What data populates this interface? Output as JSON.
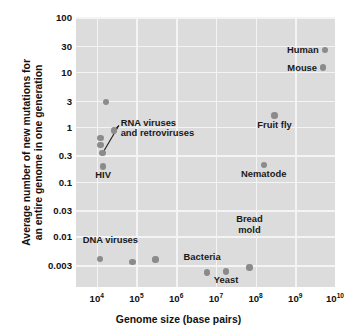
{
  "chart_data": {
    "type": "scatter",
    "title": "",
    "xlabel": "Genome size (base pairs)",
    "ylabel_line1": "Average number of new mutations for",
    "ylabel_line2": "an entire genome in one generation",
    "xscale": "log",
    "yscale": "log",
    "xlim": [
      3000,
      10000000000
    ],
    "ylim": [
      0.0012,
      100
    ],
    "grid": true,
    "legend": "none",
    "xticks": [
      {
        "value": 10000,
        "mantissa": "10",
        "exponent": "4"
      },
      {
        "value": 100000,
        "mantissa": "10",
        "exponent": "5"
      },
      {
        "value": 1000000,
        "mantissa": "10",
        "exponent": "6"
      },
      {
        "value": 10000000,
        "mantissa": "10",
        "exponent": "7"
      },
      {
        "value": 100000000,
        "mantissa": "10",
        "exponent": "8"
      },
      {
        "value": 1000000000,
        "mantissa": "10",
        "exponent": "9"
      },
      {
        "value": 10000000000,
        "mantissa": "10",
        "exponent": "10"
      }
    ],
    "yticks": [
      {
        "value": 100,
        "label": "100"
      },
      {
        "value": 30,
        "label": "30"
      },
      {
        "value": 10,
        "label": "10"
      },
      {
        "value": 3,
        "label": "3"
      },
      {
        "value": 1,
        "label": "1"
      },
      {
        "value": 0.3,
        "label": "0.3"
      },
      {
        "value": 0.1,
        "label": "0.1"
      },
      {
        "value": 0.03,
        "label": "0.03"
      },
      {
        "value": 0.01,
        "label": "0.01"
      },
      {
        "value": 0.003,
        "label": "0.003"
      }
    ],
    "point_color": "#8b8b8b",
    "plot_background": "#dcdcdc",
    "gridline_color": "#f4f4f4",
    "points": [
      {
        "name": "human",
        "x": 5500000000,
        "y": 25,
        "label": "Human",
        "label_pos": "right"
      },
      {
        "name": "mouse",
        "x": 5000000000,
        "y": 12,
        "label": "Mouse",
        "label_pos": "right"
      },
      {
        "name": "fruit-fly",
        "x": 300000000,
        "y": 1.6,
        "label": "Fruit fly",
        "label_pos": "below"
      },
      {
        "name": "nematode",
        "x": 160000000,
        "y": 0.2,
        "label": "Nematode",
        "label_pos": "below"
      },
      {
        "name": "rna-virus-1",
        "x": 17000,
        "y": 2.8,
        "label": "",
        "label_pos": "none"
      },
      {
        "name": "rna-virus-2",
        "x": 27000,
        "y": 0.85,
        "label": "",
        "label_pos": "none"
      },
      {
        "name": "rna-virus-3",
        "x": 12500,
        "y": 0.62,
        "label": "",
        "label_pos": "none"
      },
      {
        "name": "rna-virus-4",
        "x": 12500,
        "y": 0.47,
        "label": "",
        "label_pos": "none"
      },
      {
        "name": "rna-virus-5",
        "x": 14000,
        "y": 0.33,
        "label": "",
        "label_pos": "none"
      },
      {
        "name": "hiv",
        "x": 14500,
        "y": 0.19,
        "label": "HIV",
        "label_pos": "below"
      },
      {
        "name": "dna-virus-1",
        "x": 12000,
        "y": 0.0039,
        "label": "",
        "label_pos": "none"
      },
      {
        "name": "dna-virus-2",
        "x": 80000,
        "y": 0.0034,
        "label": "",
        "label_pos": "none"
      },
      {
        "name": "dna-virus-3",
        "x": 300000,
        "y": 0.0038,
        "label": "",
        "label_pos": "none"
      },
      {
        "name": "bacteria",
        "x": 6000000,
        "y": 0.0022,
        "label": "Bacteria",
        "label_pos": "none"
      },
      {
        "name": "yeast",
        "x": 18000000,
        "y": 0.0023,
        "label": "Yeast",
        "label_pos": "below"
      },
      {
        "name": "bread-mold",
        "x": 70000000,
        "y": 0.0027,
        "label": "",
        "label_pos": "none"
      }
    ],
    "annotations": [
      {
        "name": "rna-viruses",
        "line1": "RNA viruses",
        "line2": "and retroviruses",
        "x": 40000,
        "y": 0.95
      },
      {
        "name": "dna-viruses",
        "line1": "DNA viruses",
        "line2": "",
        "x": 22000,
        "y": 0.0085
      },
      {
        "name": "bacteria",
        "line1": "Bacteria",
        "line2": "",
        "x": 4500000,
        "y": 0.0042
      },
      {
        "name": "bread-mold",
        "line1": "Bread",
        "line2": "mold",
        "x": 70000000,
        "y": 0.0105
      }
    ],
    "leader_lines": [
      {
        "name": "rna-leader-upper",
        "from_x": 36000,
        "from_y": 1.05,
        "to_x": 27000,
        "to_y": 0.85
      },
      {
        "name": "rna-leader-lower",
        "from_x": 36000,
        "from_y": 1.05,
        "to_x": 14000,
        "to_y": 0.33
      }
    ]
  }
}
